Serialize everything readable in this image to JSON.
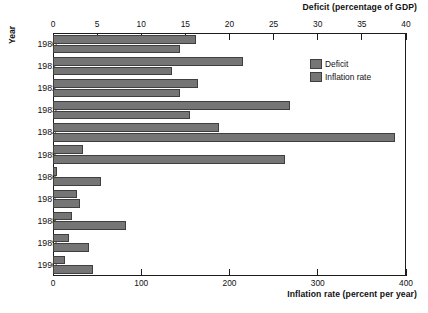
{
  "chart_data": {
    "type": "bar",
    "orientation": "horizontal",
    "title": "",
    "categories": [
      "1980",
      "1981",
      "1982",
      "1983",
      "1984",
      "1985",
      "1986",
      "1987",
      "1988",
      "1989",
      "1990"
    ],
    "ylabel": "Year",
    "grid": false,
    "legend_position": "top-right",
    "axes": [
      {
        "name": "top",
        "label": "Deficit (percentage of GDP)",
        "ticks": [
          0,
          5,
          10,
          15,
          20,
          25,
          30,
          35,
          40
        ],
        "tick_labels": [
          "0",
          "5",
          "10",
          "15",
          "20",
          "25",
          "30",
          "35",
          "40"
        ],
        "lim": [
          0,
          40
        ]
      },
      {
        "name": "bottom",
        "label": "Inflation rate (percent per year)",
        "ticks": [
          0,
          100,
          200,
          300,
          400
        ],
        "tick_labels": [
          "0",
          "100",
          "200",
          "300",
          "400"
        ],
        "lim": [
          0,
          400
        ]
      }
    ],
    "series": [
      {
        "name": "Deficit",
        "axis": "top",
        "unit": "percentage of GDP",
        "color": "#757575",
        "values": [
          16.2,
          21.5,
          16.4,
          26.8,
          18.8,
          3.4,
          0.4,
          2.7,
          2.2,
          1.8,
          1.4
        ]
      },
      {
        "name": "Inflation rate",
        "axis": "bottom",
        "unit": "percent per year",
        "color": "#757575",
        "values": [
          144,
          135,
          144,
          155,
          388,
          263,
          54,
          31,
          83,
          41,
          45
        ]
      }
    ]
  },
  "legend": {
    "items": [
      {
        "label": "Deficit"
      },
      {
        "label": "Inflation rate"
      }
    ]
  },
  "colors": {
    "bar_fill": "#757575",
    "bar_stroke": "#3f3f3f",
    "axis": "#1c1c1c",
    "text": "#111111",
    "background": "#ffffff"
  }
}
